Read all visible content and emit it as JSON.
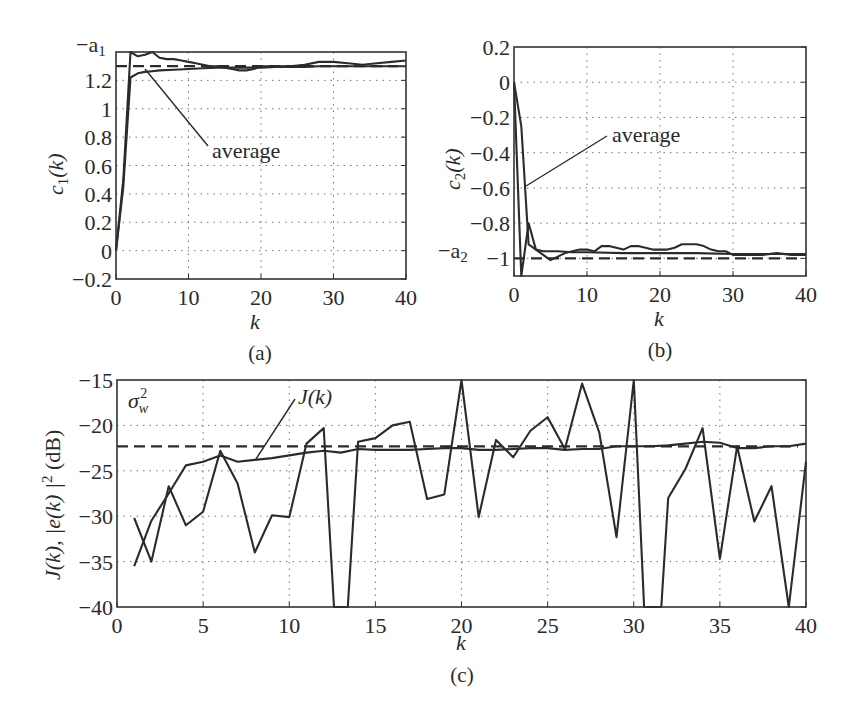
{
  "chart_data": [
    {
      "id": "a",
      "type": "line",
      "caption": "(a)",
      "xlabel": "k",
      "ylabel": "c1(k)",
      "xlim": [
        0,
        40
      ],
      "ylim": [
        -0.2,
        1.4
      ],
      "xticks": [
        0,
        10,
        20,
        30,
        40
      ],
      "yticks": [
        -0.2,
        0,
        0.2,
        0.4,
        0.6,
        0.8,
        1,
        1.2
      ],
      "ytick_labels": [
        "−0.2",
        "0",
        "0.2",
        "0.4",
        "0.6",
        "0.8",
        "1",
        "1.2"
      ],
      "top_label": "−a1",
      "grid": true,
      "reference_line": {
        "name": "−a1",
        "value": 1.3,
        "style": "dashed"
      },
      "annotation": "average",
      "series": [
        {
          "name": "single run",
          "x": [
            0,
            1,
            2,
            3,
            4,
            5,
            6,
            7,
            8,
            9,
            10,
            11,
            12,
            13,
            14,
            15,
            16,
            17,
            18,
            19,
            20,
            22,
            24,
            26,
            28,
            30,
            32,
            34,
            36,
            38,
            40
          ],
          "values": [
            0,
            0.5,
            1.45,
            1.37,
            1.38,
            1.4,
            1.36,
            1.35,
            1.35,
            1.34,
            1.33,
            1.32,
            1.31,
            1.3,
            1.3,
            1.29,
            1.28,
            1.27,
            1.27,
            1.28,
            1.3,
            1.3,
            1.3,
            1.31,
            1.33,
            1.33,
            1.32,
            1.31,
            1.32,
            1.33,
            1.34
          ]
        },
        {
          "name": "average",
          "x": [
            0,
            1,
            2,
            3,
            4,
            5,
            6,
            8,
            10,
            12,
            14,
            16,
            18,
            20,
            22,
            24,
            26,
            28,
            30,
            32,
            34,
            36,
            38,
            40
          ],
          "values": [
            0,
            0.45,
            1.22,
            1.25,
            1.26,
            1.265,
            1.27,
            1.275,
            1.28,
            1.285,
            1.29,
            1.29,
            1.29,
            1.29,
            1.295,
            1.295,
            1.295,
            1.3,
            1.3,
            1.3,
            1.3,
            1.3,
            1.3,
            1.3
          ]
        }
      ]
    },
    {
      "id": "b",
      "type": "line",
      "caption": "(b)",
      "xlabel": "k",
      "ylabel": "c2(k)",
      "xlim": [
        0,
        40
      ],
      "ylim": [
        -1.1,
        0.2
      ],
      "xticks": [
        0,
        10,
        20,
        30,
        40
      ],
      "yticks": [
        0.2,
        0,
        -0.2,
        -0.4,
        -0.6,
        -0.8,
        -1
      ],
      "ytick_labels": [
        "0.2",
        "0",
        "−0.2",
        "−0.4",
        "−0.6",
        "−0.8",
        "−1"
      ],
      "side_label": "−a2",
      "grid": true,
      "reference_line": {
        "name": "−a2",
        "value": -1.0,
        "style": "dashed"
      },
      "annotation": "average",
      "series": [
        {
          "name": "single run",
          "x": [
            0,
            1,
            2,
            3,
            4,
            5,
            6,
            7,
            8,
            9,
            10,
            11,
            12,
            13,
            14,
            15,
            16,
            17,
            18,
            19,
            20,
            21,
            22,
            23,
            24,
            25,
            26,
            27,
            28,
            29,
            30,
            32,
            34,
            36,
            38,
            40
          ],
          "values": [
            0,
            -1.1,
            -0.8,
            -0.95,
            -0.98,
            -1.01,
            -0.99,
            -0.97,
            -0.96,
            -0.95,
            -0.95,
            -0.96,
            -0.93,
            -0.93,
            -0.94,
            -0.95,
            -0.93,
            -0.93,
            -0.94,
            -0.95,
            -0.95,
            -0.95,
            -0.94,
            -0.92,
            -0.92,
            -0.92,
            -0.93,
            -0.95,
            -0.96,
            -0.96,
            -0.98,
            -0.98,
            -0.98,
            -0.97,
            -0.98,
            -0.98
          ]
        },
        {
          "name": "average",
          "x": [
            0,
            1,
            2,
            3,
            4,
            6,
            8,
            10,
            15,
            20,
            25,
            30,
            35,
            40
          ],
          "values": [
            0,
            -0.25,
            -0.92,
            -0.95,
            -0.96,
            -0.96,
            -0.965,
            -0.965,
            -0.97,
            -0.97,
            -0.97,
            -0.975,
            -0.975,
            -0.975
          ]
        }
      ]
    },
    {
      "id": "c",
      "type": "line",
      "caption": "(c)",
      "xlabel": "k",
      "ylabel": "J(k), |e(k)|² (dB)",
      "xlim": [
        0,
        40
      ],
      "ylim": [
        -40,
        -15
      ],
      "xticks": [
        0,
        5,
        10,
        15,
        20,
        25,
        30,
        35,
        40
      ],
      "yticks": [
        -15,
        -20,
        -25,
        -30,
        -35,
        -40
      ],
      "ytick_labels": [
        "−15",
        "−20",
        "−25",
        "−30",
        "−35",
        "−40"
      ],
      "grid": true,
      "reference_line": {
        "name": "σw²",
        "value": -22.3,
        "style": "dashed"
      },
      "annotations": [
        "σw²",
        "J(k)"
      ],
      "series": [
        {
          "name": "J(k)",
          "x": [
            1,
            2,
            3,
            4,
            5,
            6,
            7,
            8,
            9,
            10,
            11,
            12,
            13,
            14,
            15,
            16,
            17,
            18,
            19,
            20,
            21,
            22,
            23,
            24,
            25,
            26,
            27,
            28,
            29,
            30,
            31,
            32,
            33,
            34,
            35,
            36,
            37,
            38,
            39,
            40
          ],
          "values": [
            -35.5,
            -30.5,
            -27.5,
            -24.4,
            -24.0,
            -23.3,
            -24.0,
            -23.8,
            -23.6,
            -23.3,
            -23.0,
            -22.8,
            -23.0,
            -22.6,
            -22.7,
            -22.7,
            -22.7,
            -22.6,
            -22.5,
            -22.5,
            -22.7,
            -22.7,
            -22.6,
            -22.5,
            -22.5,
            -22.7,
            -22.6,
            -22.6,
            -22.3,
            -22.3,
            -22.3,
            -22.2,
            -22.0,
            -21.8,
            -21.9,
            -22.5,
            -22.5,
            -22.3,
            -22.3,
            -22.0
          ]
        },
        {
          "name": "|e(k)|²",
          "x": [
            1,
            2,
            3,
            4,
            5,
            6,
            7,
            8,
            9,
            10,
            11,
            12,
            12.6,
            13.4,
            14,
            15,
            16,
            17,
            18,
            19,
            20,
            21,
            22,
            23,
            24,
            25,
            26,
            27,
            28,
            29,
            30,
            30.6,
            31.6,
            32,
            33,
            34,
            35,
            36,
            37,
            38,
            39,
            40
          ],
          "values": [
            -30.2,
            -35.0,
            -26.7,
            -31.0,
            -29.5,
            -22.8,
            -26.4,
            -34.0,
            -29.9,
            -30.1,
            -22.0,
            -20.3,
            -40,
            -40,
            -21.8,
            -21.4,
            -20.0,
            -19.6,
            -28.1,
            -27.6,
            -15.0,
            -30.1,
            -21.6,
            -23.5,
            -20.6,
            -19.1,
            -22.6,
            -15.4,
            -20.8,
            -32.3,
            -15.0,
            -40,
            -40,
            -28.0,
            -24.8,
            -20.3,
            -34.7,
            -22.3,
            -30.6,
            -26.7,
            -40,
            -24.0
          ]
        }
      ]
    }
  ],
  "captions": {
    "a": "(a)",
    "b": "(b)",
    "c": "(c)"
  },
  "labels": {
    "a_ylabel_main": "c",
    "a_ylabel_sub": "1",
    "a_ylabel_arg": "(k)",
    "a_top": "−a",
    "a_top_sub": "1",
    "a_annot": "average",
    "b_ylabel_main": "c",
    "b_ylabel_sub": "2",
    "b_ylabel_arg": "(k)",
    "b_side": "−a",
    "b_side_sub": "2",
    "b_annot": "average",
    "c_ylabel": "J(k),  |e(k) |",
    "c_ylabel_sup": "2",
    "c_ylabel_tail": " (dB)",
    "c_sigma": "σ",
    "c_sigma_sub": "w",
    "c_sigma_sup": "2",
    "c_annot": "J(k)",
    "xlabel": "k"
  }
}
